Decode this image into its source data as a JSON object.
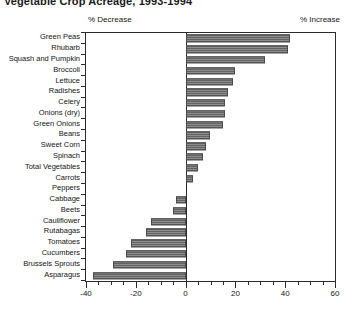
{
  "title": "Vegetable Crop Acreage, 1993-1994",
  "headers": {
    "decrease": "% Decrease",
    "increase": "% Increase"
  },
  "chart_data": {
    "type": "bar",
    "orientation": "horizontal",
    "title": "Vegetable Crop Acreage, 1993-1994",
    "xlabel": "",
    "ylabel": "",
    "xlim": [
      -40,
      60
    ],
    "xticks": [
      -40,
      -20,
      0,
      20,
      40,
      60
    ],
    "xtick_labels": [
      "-40",
      "-20",
      "0",
      "20",
      "40",
      "60"
    ],
    "minor_tick_step": 5,
    "grid": false,
    "legend": false,
    "bar_color": "#6e6e6e",
    "bar_edge_color": "#4a4a4a",
    "annotations": [
      "% Decrease",
      "% Increase"
    ],
    "categories": [
      "Green Peas",
      "Rhubarb",
      "Squash and Pumpkin",
      "Broccoli",
      "Lettuce",
      "Radishes",
      "Celery",
      "Onions (dry)",
      "Green Onions",
      "Beans",
      "Sweet Corn",
      "Spinach",
      "Total Vegetables",
      "Carrots",
      "Peppers",
      "Cabbage",
      "Beets",
      "Cauliflower",
      "Rutabagas",
      "Tomatoes",
      "Cucumbers",
      "Brussels Sprouts",
      "Asparagus"
    ],
    "values": [
      42,
      41,
      32,
      20,
      19,
      17,
      16,
      16,
      15,
      10,
      8,
      7,
      5,
      3,
      0,
      -4,
      -5,
      -14,
      -16,
      -22,
      -24,
      -29,
      -37
    ]
  }
}
